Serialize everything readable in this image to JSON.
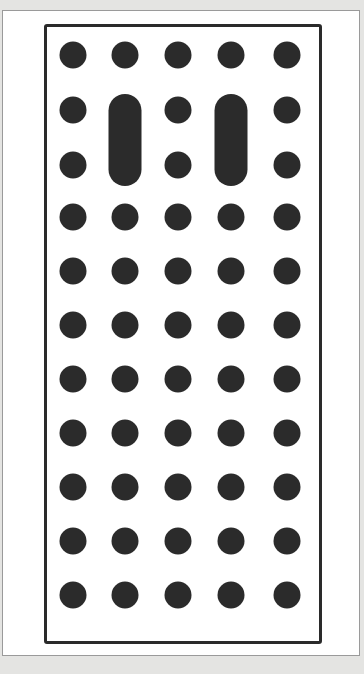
{
  "diagram": {
    "colors": {
      "background": "#e4e4e2",
      "panel": "#ffffff",
      "board_border": "#2a2a2a",
      "dot": "#2b2b2b"
    },
    "grid": {
      "columns": 5,
      "rows": 11,
      "column_x": [
        73,
        125,
        178,
        231,
        287
      ],
      "row_y": [
        55,
        110,
        165,
        217,
        271,
        325,
        379,
        433,
        487,
        541,
        595
      ]
    },
    "pills": [
      {
        "column": 2,
        "row_start": 2,
        "row_end": 3,
        "x": 125,
        "top": 94,
        "bottom": 186
      },
      {
        "column": 4,
        "row_start": 2,
        "row_end": 3,
        "x": 231,
        "top": 94,
        "bottom": 186
      }
    ]
  }
}
